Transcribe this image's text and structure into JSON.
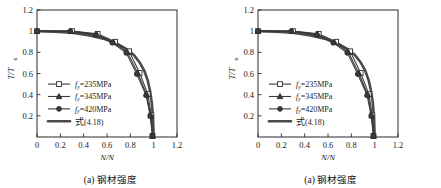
{
  "figure": {
    "panels": [
      {
        "caption": "(a) 钢材强度",
        "xlabel_main": "N/N",
        "xlabel_sub": "u",
        "ylabel_main": "T/T",
        "ylabel_sub": "u"
      },
      {
        "caption": "(a) 钢材强度",
        "xlabel_main": "N/N",
        "xlabel_sub": "u",
        "ylabel_main": "T/T",
        "ylabel_sub": "u"
      }
    ]
  },
  "legend": {
    "items": [
      {
        "symbol": "f",
        "sub": "y",
        "label": "=235MPa",
        "marker": "open-square",
        "name": "legend-item-235"
      },
      {
        "symbol": "f",
        "sub": "y",
        "label": "=345MPa",
        "marker": "filled-triangle",
        "name": "legend-item-345"
      },
      {
        "symbol": "f",
        "sub": "y",
        "label": "=420MPa",
        "marker": "filled-circle",
        "name": "legend-item-420"
      },
      {
        "symbol": "式",
        "sub": "",
        "label": "(4.18)",
        "marker": "thick-line",
        "name": "legend-item-formula"
      }
    ]
  },
  "chart_data": [
    {
      "type": "line",
      "title": "(a) 钢材强度",
      "xlabel": "N/Nu",
      "ylabel": "T/Tu",
      "xlim": [
        0,
        1.2
      ],
      "ylim": [
        0,
        1.2
      ],
      "xticks": [
        0,
        0.2,
        0.4,
        0.6,
        0.8,
        1,
        1.2
      ],
      "xticklabels": [
        "0",
        "0.2",
        "0.4",
        "0.6",
        "0.8",
        "1",
        "1.2"
      ],
      "yticks": [
        0.2,
        0.4,
        0.6,
        0.8,
        1,
        1.2
      ],
      "yticklabels": [
        "0.2",
        "0.4",
        "0.6",
        "0.8",
        "1",
        "1.2"
      ],
      "grid": false,
      "legend_position": "lower-left-inside",
      "series": [
        {
          "name": "fy=235MPa",
          "marker": "open-square",
          "x": [
            0,
            0.3,
            0.52,
            0.67,
            0.79,
            0.88,
            0.95,
            0.98,
            0.99
          ],
          "y": [
            1.0,
            1.0,
            0.975,
            0.9,
            0.81,
            0.605,
            0.405,
            0.205,
            0.01
          ]
        },
        {
          "name": "fy=345MPa",
          "marker": "filled-triangle",
          "x": [
            0,
            0.29,
            0.51,
            0.655,
            0.775,
            0.865,
            0.94,
            0.975,
            0.99
          ],
          "y": [
            1.0,
            1.0,
            0.97,
            0.895,
            0.8,
            0.6,
            0.4,
            0.2,
            0.01
          ]
        },
        {
          "name": "fy=420MPa",
          "marker": "filled-circle",
          "x": [
            0,
            0.285,
            0.505,
            0.645,
            0.765,
            0.855,
            0.935,
            0.97,
            0.99
          ],
          "y": [
            1.0,
            1.0,
            0.965,
            0.89,
            0.795,
            0.595,
            0.395,
            0.2,
            0.01
          ]
        },
        {
          "name": "式(4.18)",
          "marker": "none",
          "thick": true,
          "x": [
            0,
            0.15,
            0.3,
            0.45,
            0.58,
            0.68,
            0.76,
            0.83,
            0.88,
            0.92,
            0.95,
            0.97,
            0.985,
            0.995,
            1.0
          ],
          "y": [
            1.0,
            0.995,
            0.985,
            0.96,
            0.925,
            0.885,
            0.835,
            0.775,
            0.705,
            0.625,
            0.53,
            0.43,
            0.315,
            0.17,
            0.0
          ]
        }
      ]
    },
    {
      "type": "line",
      "title": "(a) 钢材强度",
      "xlabel": "N/Nu",
      "ylabel": "T/Tu",
      "xlim": [
        0,
        1.2
      ],
      "ylim": [
        0,
        1.2
      ],
      "xticks": [
        0,
        0.2,
        0.4,
        0.6,
        0.8,
        1,
        1.2
      ],
      "xticklabels": [
        "0",
        "0.2",
        "0.4",
        "0.6",
        "0.8",
        "1",
        "1.2"
      ],
      "yticks": [
        0.2,
        0.4,
        0.6,
        0.8,
        1,
        1.2
      ],
      "yticklabels": [
        "0.2",
        "0.4",
        "0.6",
        "0.8",
        "1",
        "1.2"
      ],
      "grid": false,
      "legend_position": "lower-left-inside",
      "series": [
        {
          "name": "fy=235MPa",
          "marker": "open-square",
          "x": [
            0,
            0.3,
            0.52,
            0.67,
            0.79,
            0.88,
            0.95,
            0.98,
            0.99
          ],
          "y": [
            1.0,
            1.0,
            0.975,
            0.9,
            0.81,
            0.605,
            0.405,
            0.205,
            0.01
          ]
        },
        {
          "name": "fy=345MPa",
          "marker": "filled-triangle",
          "x": [
            0,
            0.29,
            0.51,
            0.655,
            0.775,
            0.865,
            0.94,
            0.975,
            0.99
          ],
          "y": [
            1.0,
            1.0,
            0.97,
            0.895,
            0.8,
            0.6,
            0.4,
            0.2,
            0.01
          ]
        },
        {
          "name": "fy=420MPa",
          "marker": "filled-circle",
          "x": [
            0,
            0.285,
            0.505,
            0.645,
            0.765,
            0.855,
            0.935,
            0.97,
            0.99
          ],
          "y": [
            1.0,
            1.0,
            0.965,
            0.89,
            0.795,
            0.595,
            0.395,
            0.2,
            0.01
          ]
        },
        {
          "name": "式(4.18)",
          "marker": "none",
          "thick": true,
          "x": [
            0,
            0.15,
            0.3,
            0.45,
            0.58,
            0.68,
            0.76,
            0.83,
            0.88,
            0.92,
            0.95,
            0.97,
            0.985,
            0.995,
            1.0
          ],
          "y": [
            1.0,
            0.995,
            0.985,
            0.96,
            0.925,
            0.885,
            0.835,
            0.775,
            0.705,
            0.625,
            0.53,
            0.43,
            0.315,
            0.17,
            0.0
          ]
        }
      ]
    }
  ],
  "colors": {
    "axis": "#2a2a2a",
    "curve": "#3a3a3a",
    "curve_thick": "#4a4a4a",
    "background": "#ffffff"
  }
}
